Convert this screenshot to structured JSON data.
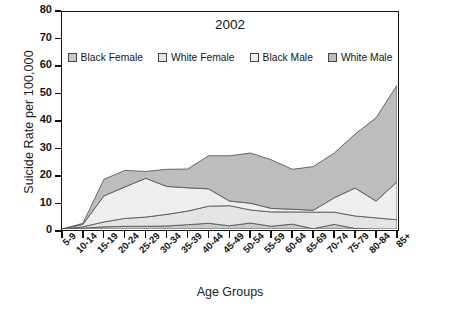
{
  "chart_data": {
    "type": "area",
    "title": "2002",
    "xlabel": "Age Groups",
    "ylabel": "Suicide Rate per 100,000",
    "categories": [
      "5-9",
      "10-14",
      "15-19",
      "20-24",
      "25-29",
      "30-34",
      "35-39",
      "40-44",
      "45-49",
      "50-54",
      "55-59",
      "60-64",
      "65-69",
      "70-74",
      "75-79",
      "80-84",
      "85+"
    ],
    "ylim": [
      0,
      80
    ],
    "yticks": [
      0,
      10,
      20,
      30,
      40,
      50,
      60,
      70,
      80
    ],
    "grid": false,
    "stacked": true,
    "legend_position": "top-center",
    "series": [
      {
        "name": "Black Female",
        "color": "#c9c9c9",
        "values": [
          0.0,
          0.3,
          0.8,
          1.0,
          1.0,
          1.1,
          1.6,
          2.1,
          1.2,
          2.2,
          1.0,
          1.8,
          0.1,
          1.7,
          0.2,
          0.0,
          0.0
        ]
      },
      {
        "name": "White Female",
        "color": "#e4e4e4",
        "values": [
          0.0,
          0.5,
          1.8,
          2.9,
          3.4,
          4.3,
          5.0,
          6.3,
          7.4,
          4.8,
          5.3,
          4.5,
          6.1,
          4.5,
          4.6,
          4.1,
          3.4
        ]
      },
      {
        "name": "Black Male",
        "color": "#efefef",
        "values": [
          0.0,
          0.9,
          9.6,
          11.6,
          14.3,
          10.3,
          8.6,
          6.4,
          1.7,
          2.5,
          1.3,
          1.0,
          0.7,
          5.3,
          10.3,
          6.2,
          14.0
        ]
      },
      {
        "name": "White Male",
        "color": "#bdbdbd",
        "values": [
          0.0,
          0.4,
          6.1,
          6.1,
          2.5,
          6.3,
          6.9,
          12.2,
          16.7,
          18.5,
          17.9,
          14.7,
          16.1,
          16.5,
          19.9,
          30.7,
          35.6
        ]
      }
    ],
    "cumulative_top_line": [
      0.0,
      2.1,
      18.3,
      21.6,
      21.2,
      22.0,
      22.1,
      27.0,
      27.0,
      28.0,
      25.5,
      22.0,
      23.0,
      28.0,
      35.0,
      41.0,
      53.0
    ]
  },
  "legend": {
    "items": [
      {
        "label": "Black Female"
      },
      {
        "label": "White Female"
      },
      {
        "label": "Black Male"
      },
      {
        "label": "White Male"
      }
    ]
  }
}
